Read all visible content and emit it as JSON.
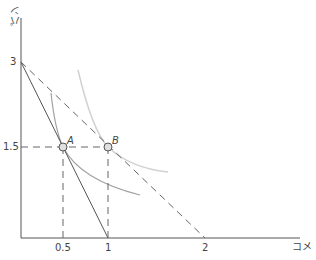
{
  "diagram": {
    "type": "economics-budget-indifference",
    "x_axis_label": "コメ",
    "y_axis_label": "パン",
    "x_ticks": [
      "0.5",
      "1",
      "2"
    ],
    "y_ticks": [
      "3",
      "1.5"
    ],
    "points": [
      {
        "label": "A",
        "x": 0.5,
        "y": 1.5
      },
      {
        "label": "B",
        "x": 1,
        "y": 1.5
      }
    ],
    "lines": [
      {
        "name": "budget-line-solid",
        "from": [
          0,
          3
        ],
        "to": [
          1,
          0
        ],
        "style": "solid"
      },
      {
        "name": "budget-line-dashed",
        "from": [
          0,
          3
        ],
        "to": [
          2,
          0
        ],
        "style": "dashed"
      }
    ],
    "curves": [
      {
        "name": "indifference-curve-A",
        "through": "A",
        "color": "#9a9a9a"
      },
      {
        "name": "indifference-curve-B",
        "through": "B",
        "color": "#d0d0d0"
      }
    ],
    "colors": {
      "axis": "#555555",
      "line": "#555555",
      "point_fill": "#e0e0e0"
    }
  }
}
